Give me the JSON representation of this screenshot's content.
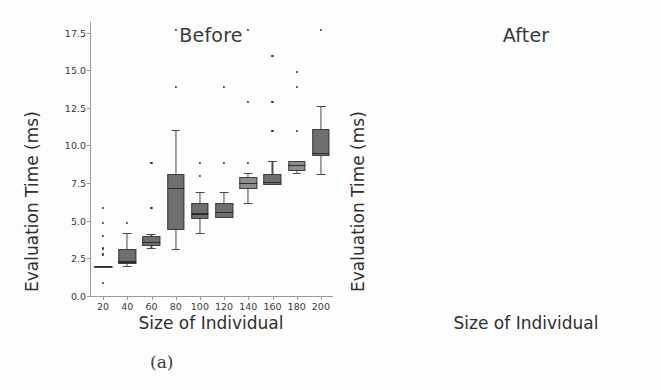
{
  "figure": {
    "caption_a": "(a)",
    "caption_b": "(b)"
  },
  "chart_data": [
    {
      "type": "box",
      "panel": "a",
      "title": "Before",
      "xlabel": "Size of Individual",
      "ylabel": "Evaluation Time (ms)",
      "ylim": [
        0.0,
        18.2
      ],
      "yticks": [
        "0.0",
        "2.5",
        "5.0",
        "7.5",
        "10.0",
        "12.5",
        "15.0",
        "17.5"
      ],
      "ytick_values": [
        0.0,
        2.5,
        5.0,
        7.5,
        10.0,
        12.5,
        15.0,
        17.5
      ],
      "categories": [
        "20",
        "40",
        "60",
        "80",
        "100",
        "120",
        "140",
        "160",
        "180",
        "200"
      ],
      "grid": false,
      "legend": "none",
      "boxes": [
        {
          "category": "20",
          "whisker_low": 2.0,
          "q1": 2.0,
          "median": 2.0,
          "q3": 2.0,
          "whisker_high": 2.0,
          "fliers": [
            1.0,
            2.9,
            3.3,
            4.1,
            5.0,
            6.0
          ]
        },
        {
          "category": "40",
          "whisker_low": 2.0,
          "q1": 2.1,
          "median": 2.3,
          "q3": 3.1,
          "whisker_high": 4.2,
          "fliers": [
            5.0
          ]
        },
        {
          "category": "60",
          "whisker_low": 3.2,
          "q1": 3.3,
          "median": 3.6,
          "q3": 4.0,
          "whisker_high": 4.1,
          "fliers": [
            6.0,
            9.0
          ]
        },
        {
          "category": "80",
          "whisker_low": 3.1,
          "q1": 4.4,
          "median": 7.2,
          "q3": 8.1,
          "whisker_high": 11.0,
          "fliers": [
            14.0,
            17.8
          ]
        },
        {
          "category": "100",
          "whisker_low": 4.2,
          "q1": 5.1,
          "median": 5.5,
          "q3": 6.2,
          "whisker_high": 6.9,
          "fliers": [
            8.1,
            9.0
          ]
        },
        {
          "category": "120",
          "whisker_low": 5.2,
          "q1": 5.2,
          "median": 5.6,
          "q3": 6.2,
          "whisker_high": 6.9,
          "fliers": [
            9.0,
            14.0
          ]
        },
        {
          "category": "140",
          "whisker_low": 6.2,
          "q1": 7.1,
          "median": 7.5,
          "q3": 7.9,
          "whisker_high": 8.2,
          "fliers": [
            9.0,
            13.0,
            17.8
          ]
        },
        {
          "category": "160",
          "whisker_low": 7.4,
          "q1": 7.4,
          "median": 7.6,
          "q3": 8.1,
          "whisker_high": 9.0,
          "fliers": [
            11.1,
            13.0,
            16.1
          ]
        },
        {
          "category": "180",
          "whisker_low": 8.2,
          "q1": 8.3,
          "median": 8.7,
          "q3": 9.0,
          "whisker_high": 9.0,
          "fliers": [
            11.1,
            14.0,
            15.0
          ]
        },
        {
          "category": "200",
          "whisker_low": 8.1,
          "q1": 9.3,
          "median": 9.5,
          "q3": 11.1,
          "whisker_high": 12.6,
          "fliers": [
            17.8
          ]
        }
      ]
    },
    {
      "type": "box",
      "panel": "b",
      "title": "After",
      "xlabel": "Size of Individual",
      "ylabel": "Evaluation Time (ms)",
      "ylim": [
        0.0,
        18.2
      ],
      "yticks": [
        "0.0",
        "2.5",
        "5.0",
        "7.5",
        "10.0",
        "12.5",
        "15.0",
        "17.5"
      ],
      "ytick_values": [
        0.0,
        2.5,
        5.0,
        7.5,
        10.0,
        12.5,
        15.0,
        17.5
      ],
      "categories": [
        "20",
        "40",
        "60",
        "80",
        "100",
        "120",
        "140",
        "160",
        "180",
        "200"
      ],
      "grid": false,
      "legend": "none",
      "boxes": [
        {
          "category": "20",
          "whisker_low": 0.55,
          "q1": 0.65,
          "median": 0.72,
          "q3": 0.8,
          "whisker_high": 0.95,
          "fliers": []
        },
        {
          "category": "40",
          "whisker_low": 1.1,
          "q1": 1.2,
          "median": 1.3,
          "q3": 1.4,
          "whisker_high": 1.55,
          "fliers": [
            2.1
          ]
        },
        {
          "category": "60",
          "whisker_low": 1.55,
          "q1": 1.65,
          "median": 1.75,
          "q3": 1.85,
          "whisker_high": 1.95,
          "fliers": []
        },
        {
          "category": "80",
          "whisker_low": 1.85,
          "q1": 1.95,
          "median": 2.05,
          "q3": 2.15,
          "whisker_high": 2.3,
          "fliers": []
        },
        {
          "category": "100",
          "whisker_low": 2.35,
          "q1": 2.45,
          "median": 2.55,
          "q3": 2.65,
          "whisker_high": 2.8,
          "fliers": [
            3.1
          ]
        },
        {
          "category": "120",
          "whisker_low": 2.6,
          "q1": 2.7,
          "median": 2.8,
          "q3": 2.9,
          "whisker_high": 3.0,
          "fliers": [
            3.5
          ]
        },
        {
          "category": "140",
          "whisker_low": 3.0,
          "q1": 3.1,
          "median": 3.2,
          "q3": 3.3,
          "whisker_high": 3.4,
          "fliers": []
        },
        {
          "category": "160",
          "whisker_low": 3.35,
          "q1": 3.45,
          "median": 3.55,
          "q3": 3.65,
          "whisker_high": 3.8,
          "fliers": [
            4.6
          ]
        },
        {
          "category": "180",
          "whisker_low": 3.55,
          "q1": 3.65,
          "median": 3.75,
          "q3": 3.85,
          "whisker_high": 3.95,
          "fliers": []
        },
        {
          "category": "200",
          "whisker_low": 3.7,
          "q1": 3.8,
          "median": 3.88,
          "q3": 3.96,
          "whisker_high": 4.05,
          "fliers": []
        }
      ]
    }
  ]
}
